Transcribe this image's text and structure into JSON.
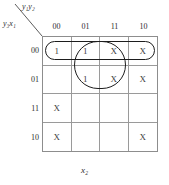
{
  "labels": {
    "top_vars": "y₁y₂",
    "left_vars": "y₃x₁",
    "bottom_var": "x₂"
  },
  "column_headers": [
    "00",
    "01",
    "11",
    "10"
  ],
  "row_headers": [
    "00",
    "01",
    "11",
    "10"
  ],
  "cells": [
    [
      "1",
      "1",
      "X",
      "X"
    ],
    [
      "",
      "1",
      "X",
      "X"
    ],
    [
      "X",
      "",
      "",
      ""
    ],
    [
      "X",
      "",
      "",
      "X"
    ]
  ],
  "groups": [
    {
      "name": "row-00-group",
      "shape": "rounded-rect",
      "rows": [
        0,
        0
      ],
      "cols": [
        0,
        3
      ]
    },
    {
      "name": "cols-01-11-group",
      "shape": "rounded-rect",
      "rows": [
        0,
        1
      ],
      "cols": [
        1,
        2
      ]
    }
  ],
  "colors": {
    "grid_line": "#9a9a9a",
    "grid_border": "#8d8d8d",
    "group_stroke": "#1d1d1d",
    "text": "#3d3d3d",
    "background": "#ffffff"
  }
}
